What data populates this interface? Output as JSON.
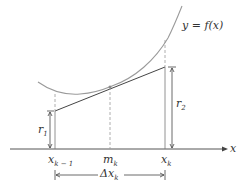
{
  "diagram": {
    "curve_label": "y = f(x)",
    "axis_label": "x",
    "ticks": [
      {
        "base": "x",
        "sub": "k − 1"
      },
      {
        "base": "m",
        "sub": "k"
      },
      {
        "base": "x",
        "sub": "k"
      }
    ],
    "r1": {
      "base": "r",
      "sub": "1"
    },
    "r2": {
      "base": "r",
      "sub": "2"
    },
    "delta": {
      "base": "Δx",
      "sub": "k"
    },
    "colors": {
      "curve": "#9a9a9a",
      "line": "#444444",
      "axis": "#555555",
      "dashed": "#999999",
      "text": "#333333"
    }
  }
}
